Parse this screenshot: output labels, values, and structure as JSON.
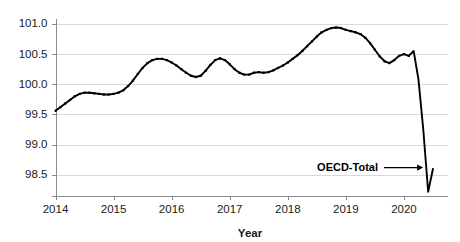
{
  "chart_data": {
    "type": "line",
    "title": "",
    "xlabel": "Year",
    "ylabel": "",
    "xlim": [
      2014.0,
      2020.75
    ],
    "ylim": [
      98.15,
      101.08
    ],
    "grid": true,
    "legend_position": "none",
    "y_ticks": [
      "101.0",
      "100.5",
      "100.0",
      "99.5",
      "99.0",
      "98.5"
    ],
    "y_tick_values": [
      101.0,
      100.5,
      100.0,
      99.5,
      99.0,
      98.5
    ],
    "x_ticks": [
      "2014",
      "2015",
      "2016",
      "2017",
      "2018",
      "2019",
      "2020"
    ],
    "x_tick_values": [
      2014,
      2015,
      2016,
      2017,
      2018,
      2019,
      2020
    ],
    "series": [
      {
        "name": "OECD-Total",
        "color": "#000000",
        "marker": "square",
        "x": [
          2014.0,
          2014.083,
          2014.167,
          2014.25,
          2014.333,
          2014.417,
          2014.5,
          2014.583,
          2014.667,
          2014.75,
          2014.833,
          2014.917,
          2015.0,
          2015.083,
          2015.167,
          2015.25,
          2015.333,
          2015.417,
          2015.5,
          2015.583,
          2015.667,
          2015.75,
          2015.833,
          2015.917,
          2016.0,
          2016.083,
          2016.167,
          2016.25,
          2016.333,
          2016.417,
          2016.5,
          2016.583,
          2016.667,
          2016.75,
          2016.833,
          2016.917,
          2017.0,
          2017.083,
          2017.167,
          2017.25,
          2017.333,
          2017.417,
          2017.5,
          2017.583,
          2017.667,
          2017.75,
          2017.833,
          2017.917,
          2018.0,
          2018.083,
          2018.167,
          2018.25,
          2018.333,
          2018.417,
          2018.5,
          2018.583,
          2018.667,
          2018.75,
          2018.833,
          2018.917,
          2019.0,
          2019.083,
          2019.167,
          2019.25,
          2019.333,
          2019.417,
          2019.5,
          2019.583,
          2019.667,
          2019.75,
          2019.833,
          2019.917,
          2020.0,
          2020.083,
          2020.167,
          2020.25,
          2020.333,
          2020.417,
          2020.5
        ],
        "values": [
          99.56,
          99.62,
          99.68,
          99.74,
          99.8,
          99.84,
          99.86,
          99.86,
          99.85,
          99.84,
          99.83,
          99.83,
          99.84,
          99.86,
          99.9,
          99.97,
          100.06,
          100.17,
          100.27,
          100.35,
          100.4,
          100.42,
          100.42,
          100.4,
          100.36,
          100.31,
          100.25,
          100.19,
          100.14,
          100.12,
          100.14,
          100.22,
          100.32,
          100.4,
          100.43,
          100.4,
          100.33,
          100.25,
          100.19,
          100.16,
          100.16,
          100.19,
          100.2,
          100.19,
          100.2,
          100.23,
          100.27,
          100.31,
          100.36,
          100.42,
          100.48,
          100.55,
          100.63,
          100.71,
          100.79,
          100.86,
          100.9,
          100.93,
          100.94,
          100.93,
          100.9,
          100.88,
          100.86,
          100.83,
          100.77,
          100.68,
          100.57,
          100.46,
          100.38,
          100.35,
          100.4,
          100.47,
          100.5,
          100.47,
          100.55,
          100.08,
          99.25,
          98.22,
          98.6
        ]
      }
    ],
    "annotations": [
      {
        "text": "OECD-Total",
        "target_x": 2020.33,
        "target_y": 98.62,
        "type": "arrow-leader"
      }
    ]
  }
}
